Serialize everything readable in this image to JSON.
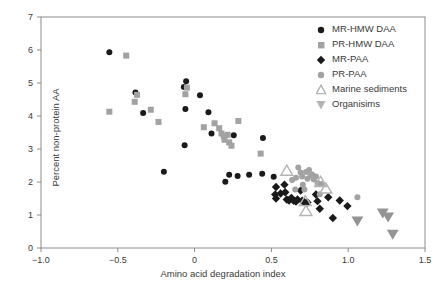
{
  "chart_data": {
    "type": "scatter",
    "title": "",
    "xlabel": "Amino acid degradation index",
    "ylabel": "Percent non-protein AA",
    "xlim": [
      -1.0,
      1.5
    ],
    "ylim": [
      0,
      7
    ],
    "xticks": [
      -1.0,
      -0.5,
      0,
      0.5,
      1.0,
      1.5
    ],
    "xticklabels": [
      "−1.0",
      "−0.5",
      "0",
      "0.5",
      "1.0",
      "1.5"
    ],
    "yticks": [
      0,
      1,
      2,
      3,
      4,
      5,
      6,
      7
    ],
    "yticklabels": [
      "0",
      "1",
      "2",
      "3",
      "4",
      "5",
      "6",
      "7"
    ],
    "grid": false,
    "legend_position": "top-right",
    "series": [
      {
        "name": "MR-HMW DAA",
        "marker": "circle",
        "color": "#1a1a1a",
        "size": 6,
        "points": [
          [
            -0.555,
            5.93
          ],
          [
            -0.385,
            4.71
          ],
          [
            -0.335,
            4.09
          ],
          [
            -0.07,
            4.88
          ],
          [
            -0.055,
            5.05
          ],
          [
            -0.06,
            4.21
          ],
          [
            -0.065,
            3.11
          ],
          [
            0.035,
            4.63
          ],
          [
            0.09,
            4.11
          ],
          [
            0.11,
            3.47
          ],
          [
            0.255,
            3.42
          ],
          [
            0.445,
            3.33
          ],
          [
            -0.2,
            2.31
          ],
          [
            0.2,
            2.01
          ],
          [
            0.225,
            2.22
          ],
          [
            0.28,
            2.18
          ],
          [
            0.355,
            2.22
          ],
          [
            0.44,
            2.25
          ],
          [
            0.515,
            2.16
          ]
        ]
      },
      {
        "name": "PR-HMW DAA",
        "marker": "square",
        "color": "#a2a2a2",
        "size": 6,
        "points": [
          [
            -0.445,
            5.83
          ],
          [
            -0.555,
            4.13
          ],
          [
            -0.375,
            4.64
          ],
          [
            -0.39,
            4.43
          ],
          [
            -0.285,
            4.19
          ],
          [
            -0.235,
            3.82
          ],
          [
            -0.05,
            4.86
          ],
          [
            -0.06,
            4.66
          ],
          [
            0.06,
            3.66
          ],
          [
            0.13,
            3.78
          ],
          [
            0.16,
            3.63
          ],
          [
            0.175,
            3.47
          ],
          [
            0.19,
            3.38
          ],
          [
            0.195,
            3.28
          ],
          [
            0.215,
            3.43
          ],
          [
            0.225,
            3.2
          ],
          [
            0.24,
            3.1
          ],
          [
            0.285,
            3.85
          ],
          [
            0.43,
            2.86
          ]
        ]
      },
      {
        "name": "MR-PAA",
        "marker": "diamond",
        "color": "#1a1a1a",
        "size": 6,
        "points": [
          [
            0.53,
            1.85
          ],
          [
            0.525,
            1.62
          ],
          [
            0.53,
            1.5
          ],
          [
            0.56,
            1.65
          ],
          [
            0.585,
            1.92
          ],
          [
            0.59,
            1.69
          ],
          [
            0.6,
            1.47
          ],
          [
            0.615,
            1.44
          ],
          [
            0.63,
            1.52
          ],
          [
            0.645,
            1.43
          ],
          [
            0.66,
            1.41
          ],
          [
            0.67,
            1.47
          ],
          [
            0.69,
            1.74
          ],
          [
            0.7,
            1.43
          ],
          [
            0.715,
            1.39
          ],
          [
            0.735,
            1.38
          ],
          [
            0.79,
            1.62
          ],
          [
            0.8,
            1.42
          ],
          [
            0.815,
            1.19
          ],
          [
            0.87,
            1.54
          ],
          [
            0.9,
            0.91
          ],
          [
            0.945,
            1.44
          ],
          [
            0.995,
            1.27
          ]
        ]
      },
      {
        "name": "PR-PAA",
        "marker": "circle",
        "color": "#a2a2a2",
        "size": 6,
        "points": [
          [
            0.635,
            2.06
          ],
          [
            0.655,
            1.77
          ],
          [
            0.66,
            2.13
          ],
          [
            0.675,
            2.44
          ],
          [
            0.69,
            2.29
          ],
          [
            0.7,
            2.17
          ],
          [
            0.705,
            1.92
          ],
          [
            0.715,
            1.77
          ],
          [
            0.725,
            2.3
          ],
          [
            0.735,
            2.1
          ],
          [
            0.745,
            2.36
          ],
          [
            0.755,
            2.2
          ],
          [
            0.765,
            2.23
          ],
          [
            0.775,
            2.08
          ],
          [
            0.79,
            2.17
          ],
          [
            0.8,
            1.97
          ],
          [
            0.815,
            1.63
          ],
          [
            0.825,
            1.94
          ],
          [
            1.06,
            1.54
          ]
        ]
      },
      {
        "name": "Marine sediments",
        "marker": "triangle-up",
        "color": "#b4b4b4",
        "size": 9,
        "points": [
          [
            0.6,
            2.34
          ],
          [
            0.72,
            1.42
          ],
          [
            0.725,
            1.12
          ],
          [
            0.855,
            1.8
          ],
          [
            0.82,
            2.0
          ]
        ]
      },
      {
        "name": "Organisims",
        "marker": "triangle-down",
        "color": "#949494",
        "size": 9,
        "points": [
          [
            1.06,
            0.82
          ],
          [
            1.225,
            1.06
          ],
          [
            1.26,
            0.94
          ],
          [
            1.29,
            0.42
          ]
        ]
      }
    ]
  },
  "legend": {
    "entries": [
      {
        "label": "MR-HMW DAA",
        "marker": "circle-black-icon"
      },
      {
        "label": "PR-HMW DAA",
        "marker": "square-gray-icon"
      },
      {
        "label": "MR-PAA",
        "marker": "diamond-black-icon"
      },
      {
        "label": "PR-PAA",
        "marker": "circle-gray-icon"
      },
      {
        "label": "Marine sediments",
        "marker": "triangle-up-gray-icon"
      },
      {
        "label": "Organisims",
        "marker": "triangle-down-gray-icon"
      }
    ]
  },
  "colors": {
    "black_marker": "#1a1a1a",
    "gray_marker": "#a2a2a2",
    "triangle_gray": "#b4b4b4",
    "axis": "#8c8c8c",
    "text": "#3a3a3a",
    "background": "#ffffff"
  }
}
